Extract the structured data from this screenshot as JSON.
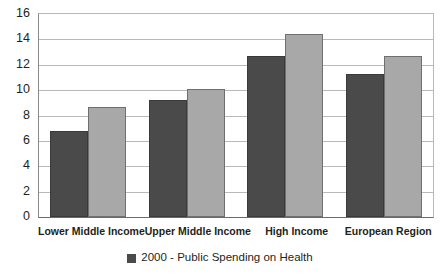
{
  "chart_data": {
    "type": "bar",
    "title": "",
    "xlabel": "",
    "ylabel": "",
    "ylim": [
      0,
      16
    ],
    "ytick_step": 2,
    "yticks": [
      16,
      14,
      12,
      10,
      8,
      6,
      4,
      2,
      0
    ],
    "grid": true,
    "legend_position": "bottom-center",
    "categories": [
      "Lower Middle Income",
      "Upper Middle Income",
      "High Income",
      "European Region"
    ],
    "series": [
      {
        "name": "2000 - Public Spending on Health",
        "color": "#4a4a4a",
        "values": [
          6.8,
          9.2,
          12.7,
          11.3
        ]
      },
      {
        "name": "",
        "color": "#a8a8a8",
        "values": [
          8.7,
          10.1,
          14.4,
          12.7
        ]
      }
    ],
    "legend": [
      {
        "label": "2000 - Public Spending on Health",
        "swatch_color": "#4a4a4a",
        "marker": "square-marker"
      }
    ]
  }
}
